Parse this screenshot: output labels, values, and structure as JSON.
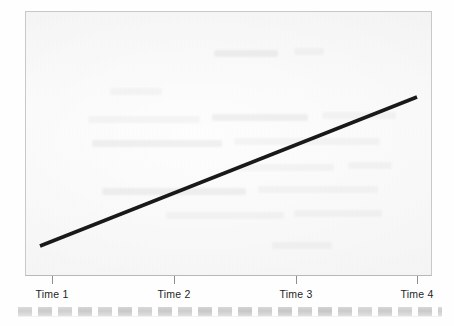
{
  "figure": {
    "kind": "scanned-line-chart",
    "background_color": "#ffffff",
    "plot_background_color": "#f7f7f7",
    "plot_border_color": "#c9c9c9",
    "line_color": "#1a1a1a",
    "tick_color": "#8f8f8f",
    "label_color": "#1f1f1f"
  },
  "axis": {
    "tick_labels": [
      "Time 1",
      "Time 2",
      "Time 3",
      "Time 4"
    ]
  },
  "artifacts": {
    "scan_edge_strip_color": "#c9c9c9",
    "ghost_text_note": ""
  },
  "chart_data": {
    "type": "line",
    "title": "",
    "subtitle": "",
    "xlabel": "",
    "ylabel": "",
    "categories": [
      "Time 1",
      "Time 2",
      "Time 3",
      "Time 4"
    ],
    "x": [
      1,
      2,
      3,
      4
    ],
    "series": [
      {
        "name": "Trend",
        "values": [
          16,
          44,
          72,
          100
        ]
      }
    ],
    "xlim": [
      0.9,
      4.05
    ],
    "ylim": [
      0,
      100
    ],
    "grid": false,
    "legend": "none",
    "axis_tick_values_shown": false,
    "y_axis_visible": false,
    "x_axis_visible": true,
    "annotations": []
  }
}
